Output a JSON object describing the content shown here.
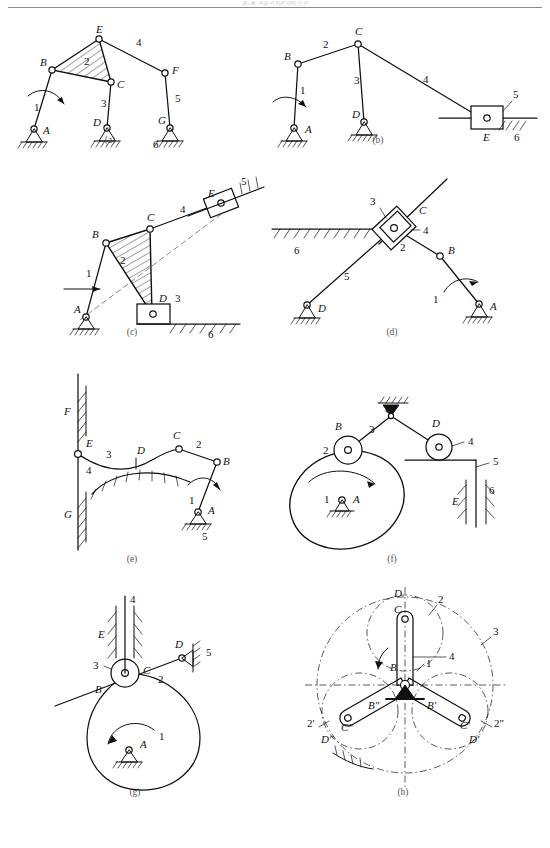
{
  "page": {
    "header_text": "第2章 平面机构的结构分析",
    "width": 550,
    "height": 848,
    "background": "#ffffff",
    "ink": "#111111"
  },
  "figures": [
    {
      "id": "a",
      "caption": "(a)",
      "description": "Six-bar linkage with ternary hatched link BEC and three ground pivots A, D, G",
      "point_labels": [
        "E",
        "B",
        "C",
        "F",
        "A",
        "D",
        "G"
      ],
      "link_numbers": [
        "1",
        "2",
        "3",
        "4",
        "5",
        "6"
      ],
      "has_hatched_body": true,
      "driver_arrow": true,
      "ground_pivots": [
        "A",
        "D",
        "G"
      ]
    },
    {
      "id": "b",
      "caption": "(b)",
      "description": "Slider-crank six-bar: crank 1 at A, coupler 2 to C, rocker 3 at D, link 4 to slider 5 at E on frame 6",
      "point_labels": [
        "B",
        "C",
        "A",
        "D",
        "E"
      ],
      "link_numbers": [
        "1",
        "2",
        "3",
        "4",
        "5",
        "6"
      ],
      "has_hatched_body": false,
      "driver_arrow": true,
      "ground_pivots": [
        "A",
        "D"
      ],
      "slider_at": "E"
    },
    {
      "id": "c",
      "caption": "(c)",
      "description": "Crank 1 at A drives hatched ternary link 2 (B-C-D), slider 3 at D on horizontal guide 6, link 4 to slider 5 on inclined guide at E",
      "point_labels": [
        "E",
        "C",
        "B",
        "A",
        "D"
      ],
      "link_numbers": [
        "1",
        "2",
        "3",
        "4",
        "5",
        "6"
      ],
      "has_hatched_body": true,
      "driver_arrow": true,
      "ground_pivots": [
        "A"
      ],
      "sliders_at": [
        "D",
        "E"
      ]
    },
    {
      "id": "d",
      "caption": "(d)",
      "description": "Crank 1 at A, link 2 to block, nested sliders 3 and 4 at C on horizontal frame 6, link 5 to ground pivot D",
      "point_labels": [
        "C",
        "B",
        "D",
        "A"
      ],
      "link_numbers": [
        "1",
        "2",
        "3",
        "4",
        "5",
        "6"
      ],
      "has_hatched_body": false,
      "driver_arrow": true,
      "ground_pivots": [
        "A",
        "D"
      ],
      "sliders_at": [
        "C"
      ]
    },
    {
      "id": "e",
      "caption": "(e)",
      "description": "Crank 1 at A, link 2 to C, curved link 3 riding on fixed cam surface 4 at D, pivot E sliding in vertical guide F-G, frame 5",
      "point_labels": [
        "F",
        "E",
        "D",
        "C",
        "B",
        "A",
        "G"
      ],
      "link_numbers": [
        "1",
        "2",
        "3",
        "4",
        "5"
      ],
      "has_hatched_body": false,
      "driver_arrow": true,
      "ground_pivots": [
        "A"
      ],
      "cam_contact_at": "D"
    },
    {
      "id": "f",
      "caption": "(f)",
      "description": "Eccentric cam 1 about A drives roller 2 at B, rocking lever 3 pivoted at C overhead, roller 4 at D on follower plate 5 guided at E against frame 6",
      "point_labels": [
        "C",
        "B",
        "D",
        "A",
        "E"
      ],
      "link_numbers": [
        "1",
        "2",
        "3",
        "4",
        "5",
        "6"
      ],
      "has_hatched_body": false,
      "rotation_arrow": true,
      "ground_pivots": [
        "A",
        "C"
      ],
      "rollers_at": [
        "B",
        "D"
      ]
    },
    {
      "id": "g",
      "caption": "(g)",
      "description": "Pear-shaped cam 1 about A contacts flat link 2 at B, roller 3 at C carrying translating follower 4 in guide E, link 2 pivoted at D on frame 5",
      "point_labels": [
        "E",
        "C",
        "D",
        "B",
        "A"
      ],
      "link_numbers": [
        "1",
        "2",
        "3",
        "4",
        "5"
      ],
      "has_hatched_body": false,
      "rotation_arrow": true,
      "ground_pivots": [
        "A",
        "D"
      ],
      "rollers_at": [
        "C"
      ]
    },
    {
      "id": "h",
      "caption": "(h)",
      "description": "Three-arm planetary / parallel-crank mechanism with carrier 1, planet links 2, 2', 2'', ring 3 and centre member 4; crank pins B, B', B'' and C, C', C''; pitch circles D, D', D''",
      "point_labels": [
        "D",
        "C",
        "B",
        "B'",
        "B\"",
        "C'",
        "C\"",
        "D'",
        "D\""
      ],
      "link_numbers": [
        "1",
        "2",
        "2'",
        "2\"",
        "3",
        "4"
      ],
      "has_hatched_body": false,
      "rotation_arrow": true,
      "ground_pivots": [
        "centre"
      ]
    }
  ]
}
